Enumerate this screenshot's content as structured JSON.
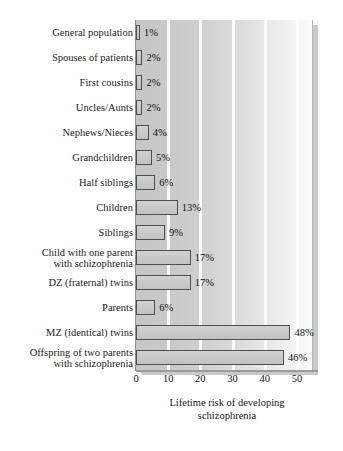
{
  "chart_data": {
    "type": "bar",
    "orientation": "horizontal",
    "title": "",
    "xlabel": "Lifetime risk of developing\nschizophrenia",
    "ylabel": "",
    "xlim": [
      0,
      55
    ],
    "xticks": [
      0,
      10,
      20,
      30,
      40,
      50
    ],
    "grid": "vertical white gridlines at each x tick",
    "legend": "none",
    "value_suffix": "%",
    "categories": [
      "General population",
      "Spouses of patients",
      "First cousins",
      "Uncles/Aunts",
      "Nephews/Nieces",
      "Grandchildren",
      "Half siblings",
      "Children",
      "Siblings",
      "Child with one parent\nwith schizophrenia",
      "DZ (fraternal) twins",
      "Parents",
      "MZ (identical) twins",
      "Offspring of two parents\nwith schizophrenia"
    ],
    "values": [
      1,
      2,
      2,
      2,
      4,
      5,
      6,
      13,
      9,
      17,
      17,
      6,
      48,
      46
    ],
    "value_labels": [
      "1%",
      "2%",
      "2%",
      "2%",
      "4%",
      "5%",
      "6%",
      "13%",
      "9%",
      "17%",
      "17%",
      "6%",
      "48%",
      "46%"
    ],
    "colors": {
      "bar_fill": "#cacaca",
      "bar_border": "#4e4e4e",
      "plot_background_left": "#c6c6c6",
      "plot_background_right": "#fbfbfb",
      "gridline": "#fdfdfd",
      "text": "#1b1b1b",
      "axis": "#9b9b9b"
    }
  }
}
